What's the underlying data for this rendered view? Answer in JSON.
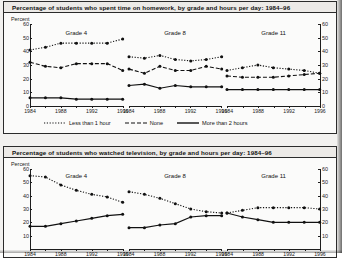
{
  "figures": [
    {
      "id": "homework",
      "title": "Percentage of students who spent time on homework, by grade and hours per day: 1984–96",
      "axis_unit": "Percent",
      "legend": [
        {
          "label": "Less than 1 hour",
          "style": "dotted"
        },
        {
          "label": "None",
          "style": "dashed"
        },
        {
          "label": "More than 2 hours",
          "style": "solid"
        }
      ],
      "panels": [
        {
          "title": "Grade 4"
        },
        {
          "title": "Grade 8"
        },
        {
          "title": "Grade 11"
        }
      ]
    },
    {
      "id": "television",
      "title": "Percentage of students who watched television, by grade and hours per day: 1984–96",
      "axis_unit": "Percent",
      "panels": [
        {
          "title": "Grade 4"
        },
        {
          "title": "Grade 8"
        },
        {
          "title": "Grade 11"
        }
      ]
    }
  ],
  "chart_data": [
    {
      "type": "line",
      "title": "Percentage of students who spent time on homework, by grade and hours per day: 1984–96",
      "xlabel": "",
      "ylabel": "Percent",
      "ylim": [
        0,
        60
      ],
      "yticks": [
        0,
        10,
        20,
        30,
        40,
        50,
        60
      ],
      "xlim": [
        1984,
        1996
      ],
      "xticks": [
        1984,
        1988,
        1992,
        1996
      ],
      "grid": false,
      "legend_position": "bottom",
      "panels": [
        {
          "name": "Grade 4",
          "x": [
            1984,
            1986,
            1988,
            1990,
            1992,
            1994,
            1996
          ],
          "series": [
            {
              "name": "Less than 1 hour",
              "style": "dotted",
              "values": [
                41,
                43,
                46,
                46,
                46,
                46,
                49
              ]
            },
            {
              "name": "None",
              "style": "dashed",
              "values": [
                32,
                29,
                28,
                31,
                31,
                31,
                26
              ]
            },
            {
              "name": "More than 2 hours",
              "style": "solid",
              "values": [
                6,
                6,
                6,
                5,
                5,
                5,
                5
              ]
            }
          ]
        },
        {
          "name": "Grade 8",
          "x": [
            1984,
            1986,
            1988,
            1990,
            1992,
            1994,
            1996
          ],
          "series": [
            {
              "name": "Less than 1 hour",
              "style": "dotted",
              "values": [
                36,
                35,
                37,
                34,
                33,
                34,
                36
              ]
            },
            {
              "name": "None",
              "style": "dashed",
              "values": [
                27,
                24,
                29,
                26,
                26,
                29,
                27
              ]
            },
            {
              "name": "More than 2 hours",
              "style": "solid",
              "values": [
                15,
                16,
                13,
                15,
                14,
                14,
                14
              ]
            }
          ]
        },
        {
          "name": "Grade 11",
          "x": [
            1984,
            1986,
            1988,
            1990,
            1992,
            1994,
            1996
          ],
          "series": [
            {
              "name": "Less than 1 hour",
              "style": "dotted",
              "values": [
                26,
                28,
                30,
                28,
                27,
                26,
                24
              ]
            },
            {
              "name": "None",
              "style": "dashed",
              "values": [
                22,
                21,
                21,
                21,
                22,
                23,
                24
              ]
            },
            {
              "name": "More than 2 hours",
              "style": "solid",
              "values": [
                12,
                12,
                12,
                12,
                12,
                12,
                12
              ]
            }
          ]
        }
      ]
    },
    {
      "type": "line",
      "title": "Percentage of students who watched television, by grade and hours per day: 1984–96",
      "xlabel": "",
      "ylabel": "Percent",
      "ylim": [
        0,
        60
      ],
      "yticks": [
        10,
        20,
        30,
        40,
        50,
        60
      ],
      "xlim": [
        1984,
        1996
      ],
      "xticks": [
        1984,
        1988,
        1992,
        1996
      ],
      "grid": false,
      "legend_position": "none",
      "panels": [
        {
          "name": "Grade 4",
          "x": [
            1984,
            1986,
            1988,
            1990,
            1992,
            1994,
            1996
          ],
          "series": [
            {
              "name": "Less than 1 hour",
              "style": "dotted",
              "values": [
                55,
                54,
                48,
                44,
                41,
                39,
                35
              ]
            },
            {
              "name": "More than 2 hours",
              "style": "solid",
              "values": [
                17,
                17,
                19,
                21,
                23,
                25,
                26
              ]
            }
          ]
        },
        {
          "name": "Grade 8",
          "x": [
            1984,
            1986,
            1988,
            1990,
            1992,
            1994,
            1996
          ],
          "series": [
            {
              "name": "Less than 1 hour",
              "style": "dotted",
              "values": [
                43,
                41,
                38,
                34,
                30,
                28,
                27
              ]
            },
            {
              "name": "More than 2 hours",
              "style": "solid",
              "values": [
                16,
                16,
                18,
                19,
                24,
                25,
                25
              ]
            }
          ]
        },
        {
          "name": "Grade 11",
          "x": [
            1984,
            1986,
            1988,
            1990,
            1992,
            1994,
            1996
          ],
          "series": [
            {
              "name": "Less than 1 hour",
              "style": "dotted",
              "values": [
                27,
                29,
                31,
                31,
                31,
                31,
                30
              ]
            },
            {
              "name": "More than 2 hours",
              "style": "solid",
              "values": [
                27,
                24,
                22,
                20,
                20,
                20,
                20
              ]
            }
          ]
        }
      ]
    }
  ]
}
